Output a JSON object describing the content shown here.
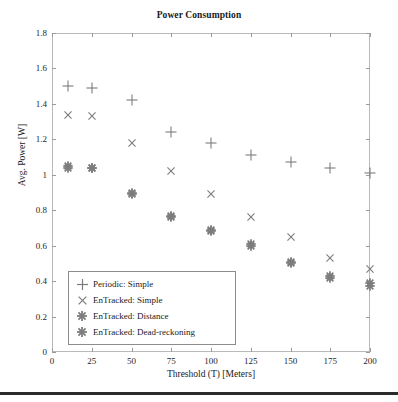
{
  "chart_data": {
    "type": "scatter",
    "title": "Power Consumption",
    "xlabel": "Threshold (T) [Meters]",
    "ylabel": "Avg. Power [W]",
    "xlim": [
      0,
      200
    ],
    "ylim": [
      0,
      1.8
    ],
    "grid": false,
    "legend_position": "lower-left-inside",
    "xticks": [
      0,
      25,
      50,
      75,
      100,
      125,
      150,
      175,
      200
    ],
    "xtick_labels": [
      "0",
      "25",
      "50",
      "75",
      "100",
      "125",
      "150",
      "175",
      "200"
    ],
    "yticks": [
      0,
      0.2,
      0.4,
      0.6,
      0.8,
      1.0,
      1.2,
      1.4,
      1.6,
      1.8
    ],
    "ytick_labels": [
      "0",
      "0.2",
      "0.4",
      "0.6",
      "0.8",
      "1",
      "1.2",
      "1.4",
      "1.6",
      "1.8"
    ],
    "marker_color": "#7d7d7d",
    "series": [
      {
        "name": "Periodic: Simple",
        "marker": "plus",
        "x": [
          10,
          25,
          50,
          75,
          100,
          125,
          150,
          175,
          200
        ],
        "values": [
          1.5,
          1.49,
          1.42,
          1.24,
          1.18,
          1.11,
          1.07,
          1.04,
          1.01
        ]
      },
      {
        "name": "EnTracked: Simple",
        "marker": "cross",
        "x": [
          10,
          25,
          50,
          75,
          100,
          125,
          150,
          175,
          200
        ],
        "values": [
          1.34,
          1.33,
          1.18,
          1.02,
          0.89,
          0.76,
          0.65,
          0.53,
          0.47
        ]
      },
      {
        "name": "EnTracked: Distance",
        "marker": "asterisk",
        "x": [
          10,
          25,
          50,
          75,
          100,
          125,
          150,
          175,
          200
        ],
        "values": [
          1.05,
          1.04,
          0.9,
          0.77,
          0.69,
          0.61,
          0.51,
          0.43,
          0.39
        ]
      },
      {
        "name": "EnTracked: Dead-reckoning",
        "marker": "asterisk",
        "x": [
          10,
          25,
          50,
          75,
          100,
          125,
          150,
          175,
          200
        ],
        "values": [
          1.04,
          1.04,
          0.89,
          0.76,
          0.68,
          0.6,
          0.5,
          0.42,
          0.37
        ]
      }
    ]
  },
  "legend": {
    "items": [
      {
        "label": "Periodic: Simple",
        "marker": "plus"
      },
      {
        "label": "EnTracked: Simple",
        "marker": "cross"
      },
      {
        "label": "EnTracked: Distance",
        "marker": "asterisk"
      },
      {
        "label": "EnTracked: Dead-reckoning",
        "marker": "asterisk"
      }
    ]
  }
}
